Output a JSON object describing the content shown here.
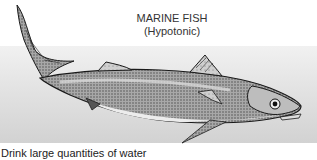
{
  "figure": {
    "title_line1": "MARINE FISH",
    "title_line2": "(Hypotonic)",
    "caption": "Drink large quantities of water",
    "colors": {
      "band_top": "#f1f1f1",
      "band_bottom": "#d2d2d2",
      "fish_outline": "#1a1a1a",
      "fish_body": "#9a9a9a",
      "fish_belly": "#e6e6e6"
    }
  }
}
